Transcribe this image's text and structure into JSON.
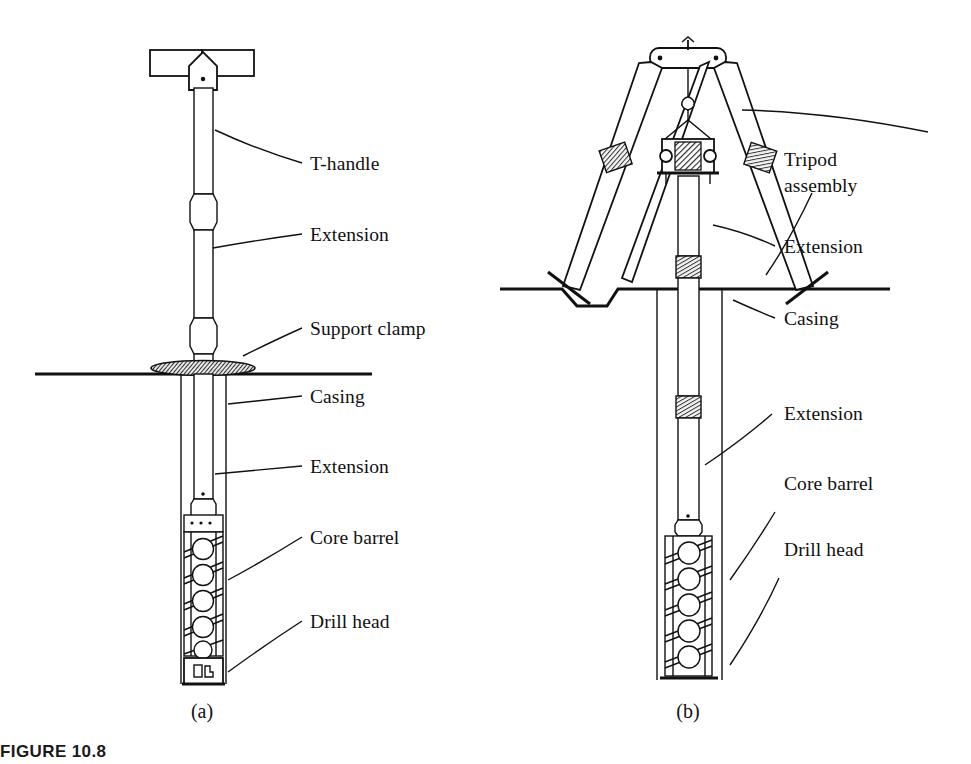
{
  "figure": {
    "caption": "FIGURE 10.8",
    "panels": [
      {
        "id": "a",
        "label": "(a)"
      },
      {
        "id": "b",
        "label": "(b)"
      }
    ]
  },
  "panel_a": {
    "labels": [
      {
        "key": "t_handle",
        "text": "T-handle"
      },
      {
        "key": "extension_top",
        "text": "Extension"
      },
      {
        "key": "support_clamp",
        "text": "Support clamp"
      },
      {
        "key": "casing",
        "text": "Casing"
      },
      {
        "key": "extension_low",
        "text": "Extension"
      },
      {
        "key": "core_barrel",
        "text": "Core barrel"
      },
      {
        "key": "drill_head",
        "text": "Drill head"
      }
    ]
  },
  "panel_b": {
    "labels": [
      {
        "key": "tripod_line1",
        "text": "Tripod"
      },
      {
        "key": "tripod_line2",
        "text": "assembly"
      },
      {
        "key": "extension_top",
        "text": "Extension"
      },
      {
        "key": "casing",
        "text": "Casing"
      },
      {
        "key": "extension_low",
        "text": "Extension"
      },
      {
        "key": "core_barrel",
        "text": "Core barrel"
      },
      {
        "key": "drill_head",
        "text": "Drill head"
      }
    ]
  },
  "colors": {
    "ink": "#111111",
    "paper": "#ffffff",
    "hatch": "#2b2b2b"
  }
}
